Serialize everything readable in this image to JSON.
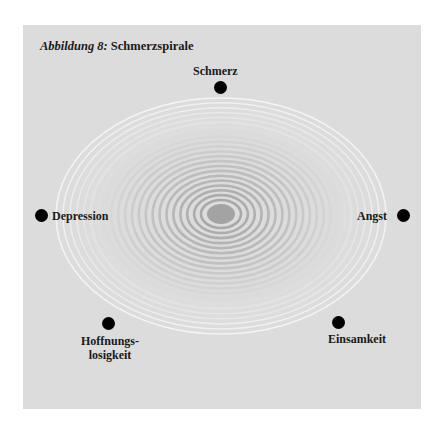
{
  "figure": {
    "title_prefix": "Abbildung 8:",
    "title_text": " Schmerzspirale",
    "colors": {
      "panel": "#dcdcdc",
      "spiral_inner": "#a8a8a8",
      "spiral_outer": "#f4f4f4",
      "core": "#a0a0a0",
      "dot": "#000000"
    }
  },
  "nodes": [
    {
      "id": "schmerz",
      "label": "Schmerz"
    },
    {
      "id": "angst",
      "label": "Angst"
    },
    {
      "id": "einsamkeit",
      "label": "Einsamkeit"
    },
    {
      "id": "hoffnungslosigkeit",
      "label_line1": "Hoffnungs-",
      "label_line2": "losigkeit"
    },
    {
      "id": "depression",
      "label": "Depression"
    }
  ]
}
